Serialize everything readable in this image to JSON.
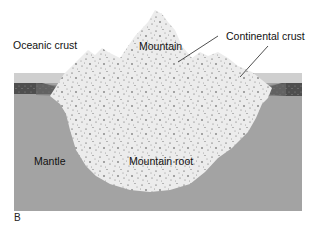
{
  "figure": {
    "panel_letter": "B",
    "colors": {
      "background": "#ffffff",
      "mantle": "#a3a3a3",
      "upper_band": "#cfcfcf",
      "oceanic_crust": "#5a5a5a",
      "continental_crust": "#ececec",
      "speckle": "#333333",
      "leader_line": "#222222"
    },
    "labels": {
      "oceanic_crust": "Oceanic crust",
      "mountain": "Mountain",
      "continental_crust": "Continental crust",
      "mantle": "Mantle",
      "mountain_root": "Mountain root"
    }
  }
}
